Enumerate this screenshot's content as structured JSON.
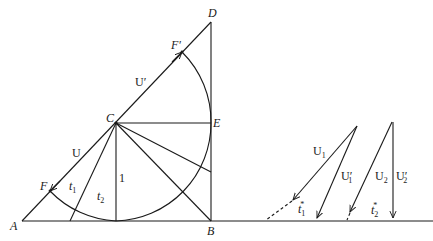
{
  "figure": {
    "points": {
      "A": "A",
      "B": "B",
      "C": "C",
      "D": "D",
      "E": "E",
      "F": "F",
      "F_prime": "F′"
    },
    "segment_labels": {
      "U": "U",
      "U_prime": "U′",
      "unit": "1",
      "t1": "t",
      "t1_sub": "1",
      "t2": "t",
      "t2_sub": "2"
    },
    "velocity_diagrams": {
      "U1": "U",
      "U1_sub": "1",
      "U1_prime": "U′",
      "U1_prime_sub": "1",
      "t1_star": "t",
      "t1_star_sub": "1",
      "t1_star_sup": "*",
      "U2": "U",
      "U2_sub": "2",
      "U2_prime": "U′",
      "U2_prime_sub": "2",
      "t2_star": "t",
      "t2_star_sub": "2",
      "t2_star_sup": "*"
    },
    "colors": {
      "ink": "#1a1a1a",
      "background": "#ffffff"
    }
  }
}
